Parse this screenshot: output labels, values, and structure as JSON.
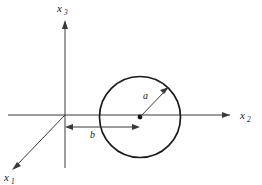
{
  "figure": {
    "type": "technical-diagram",
    "background_color": "#ffffff",
    "line_color": "#3a3a3a",
    "curve_color": "#1a1a1a"
  },
  "axes": [
    {
      "id": "x1",
      "label_base": "x",
      "label_sub": "1",
      "direction": "down-left (out of page)",
      "label_x": 6,
      "label_y": 180,
      "sub_x": 14,
      "sub_y": 183
    },
    {
      "id": "x2",
      "label_base": "x",
      "label_sub": "2",
      "direction": "right (horizontal)",
      "label_x": 240,
      "label_y": 119,
      "sub_x": 248,
      "sub_y": 122
    },
    {
      "id": "x3",
      "label_base": "x",
      "label_sub": "3",
      "direction": "up (vertical)",
      "label_x": 57,
      "label_y": 12,
      "sub_x": 65,
      "sub_y": 15
    }
  ],
  "origin": {
    "x": 65,
    "y": 115
  },
  "circle": {
    "center_x": 140,
    "center_y": 117,
    "radius": 40.5
  },
  "dimensions": [
    {
      "id": "radius",
      "label": "a",
      "label_x": 143,
      "label_y": 97,
      "from_x": 140,
      "from_y": 117,
      "to_x": 168,
      "to_y": 88
    },
    {
      "id": "offset",
      "label": "b",
      "label_x": 90,
      "label_y": 137,
      "from_x": 65,
      "from_y": 127,
      "to_x": 140,
      "to_y": 127
    }
  ]
}
